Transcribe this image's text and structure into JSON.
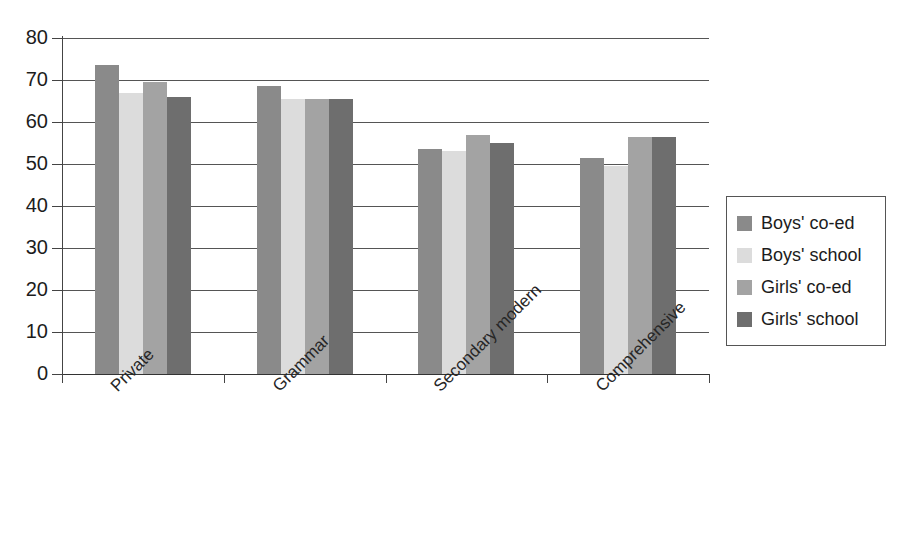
{
  "chart_data": {
    "type": "bar",
    "title": "",
    "subtitle": "",
    "xlabel": "",
    "ylabel": "",
    "categories": [
      "Private",
      "Grammar",
      "Secondary modern",
      "Comprehensive"
    ],
    "series": [
      {
        "name": "Boys' co-ed",
        "color": "#8a8a8a",
        "values": [
          73.5,
          68.5,
          53.5,
          51.5
        ]
      },
      {
        "name": "Boys' school",
        "color": "#dcdcdc",
        "values": [
          67.0,
          65.5,
          53.0,
          49.5
        ]
      },
      {
        "name": "Girls' co-ed",
        "color": "#a3a3a3",
        "values": [
          69.5,
          65.5,
          57.0,
          56.5
        ]
      },
      {
        "name": "Girls' school",
        "color": "#6e6e6e",
        "values": [
          66.0,
          65.5,
          55.0,
          56.5
        ]
      }
    ],
    "ylim": [
      0,
      80
    ],
    "yticks": [
      0,
      10,
      20,
      30,
      40,
      50,
      60,
      70,
      80
    ],
    "ytick_labels": [
      "0",
      "10",
      "20",
      "30",
      "40",
      "50",
      "60",
      "70",
      "80"
    ],
    "grid": "horizontal",
    "grid_values": [
      10,
      20,
      30,
      40,
      50,
      60,
      70,
      80
    ],
    "legend_position": "right",
    "x_tick_label_rotation": -45,
    "background_color": "#ffffff",
    "axis_color": "#444444"
  },
  "legend": {
    "items": [
      {
        "label": "Boys' co-ed",
        "color": "#8a8a8a"
      },
      {
        "label": "Boys' school",
        "color": "#dcdcdc"
      },
      {
        "label": "Girls' co-ed",
        "color": "#a3a3a3"
      },
      {
        "label": "Girls' school",
        "color": "#6e6e6e"
      }
    ]
  }
}
